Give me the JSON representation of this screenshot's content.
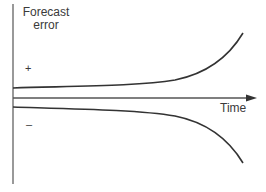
{
  "diagram": {
    "y_axis_label_line1": "Forecast",
    "y_axis_label_line2": "error",
    "x_axis_label": "Time",
    "positive_sign": "+",
    "negative_sign": "–",
    "colors": {
      "axis": "#555555",
      "curve": "#333333",
      "text": "#3a3a3a"
    }
  }
}
